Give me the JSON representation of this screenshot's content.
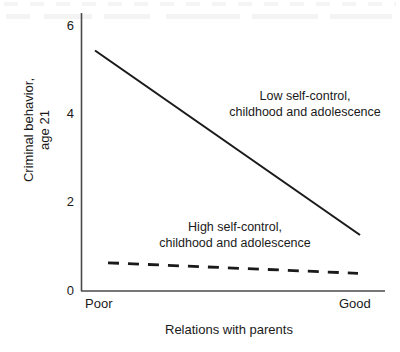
{
  "chart_data": {
    "type": "line",
    "title": "",
    "xlabel": "Relations with parents",
    "ylabel": "Criminal behavior, age 21",
    "ylabel_line1": "Criminal behavior,",
    "ylabel_line2": "age 21",
    "x": [
      "Poor",
      "Good"
    ],
    "xtick_labels": [
      "Poor",
      "Good"
    ],
    "ytick_labels": [
      "6",
      "4",
      "2",
      "0"
    ],
    "ytick_values": [
      6,
      4,
      2,
      0
    ],
    "ylim": [
      0,
      6.3
    ],
    "grid": false,
    "legend_position": "inline-annotations",
    "series": [
      {
        "name": "Low self-control, childhood and adolescence",
        "style": "solid",
        "color": "#1a1a1a",
        "values": [
          5.45,
          1.27
        ]
      },
      {
        "name": "High self-control, childhood and adolescence",
        "style": "dashed",
        "color": "#1a1a1a",
        "values": [
          0.64,
          0.4
        ]
      }
    ],
    "annotations": [
      {
        "id": "low-self-control",
        "line1": "Low self-control,",
        "line2": "childhood and adolescence"
      },
      {
        "id": "high-self-control",
        "line1": "High self-control,",
        "line2": "childhood and adolescence"
      }
    ]
  }
}
